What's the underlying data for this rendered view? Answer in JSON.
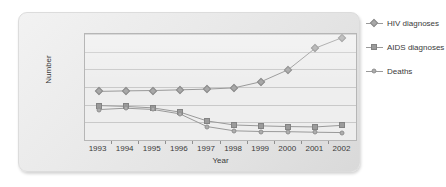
{
  "chart_data": {
    "type": "line",
    "title": "",
    "xlabel": "Year",
    "ylabel": "Number",
    "categories": [
      "1993",
      "1994",
      "1995",
      "1996",
      "1997",
      "1998",
      "1999",
      "2000",
      "2001",
      "2002"
    ],
    "ylim": [
      0,
      6000
    ],
    "yticks": [
      "6000",
      "5000",
      "4000",
      "3000",
      "2000",
      "1000",
      "0"
    ],
    "grid": true,
    "legend_position": "right",
    "series": [
      {
        "name": "HIV diagnoses",
        "marker": "diamond",
        "color": "#a8a8a8",
        "values": [
          2750,
          2780,
          2800,
          2840,
          2880,
          2950,
          3300,
          3980,
          5200,
          5800
        ]
      },
      {
        "name": "AIDS diagnoses",
        "marker": "square",
        "color": "#9b9b9b",
        "values": [
          1950,
          1900,
          1820,
          1580,
          1080,
          850,
          800,
          760,
          740,
          830
        ]
      },
      {
        "name": "Deaths",
        "marker": "circle",
        "color": "#adadad",
        "values": [
          1720,
          1800,
          1730,
          1480,
          760,
          520,
          480,
          470,
          440,
          420
        ]
      }
    ]
  },
  "axes": {
    "line_color": "#9a9a9a",
    "grid_color": "#c9c9c9",
    "plot_background": "#eeeeee"
  }
}
